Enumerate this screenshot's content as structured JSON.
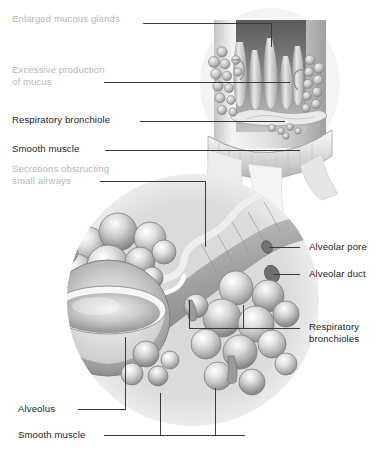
{
  "figure": {
    "style": "grayscale medical airbrush illustration with leader-line callouts",
    "palette": {
      "background": "#ffffff",
      "label_dark": "#1c1c1c",
      "label_gray": "#b9b9b9",
      "leader_line": "#3a3a3a",
      "tissue_light": "#f2f2f2",
      "tissue_mid": "#c9c9c9",
      "tissue_dark": "#8d8d8d",
      "lumen_dark": "#6e6e6e",
      "circle_tint": "#dcdcdc",
      "mucus_white": "#ffffff"
    }
  },
  "labels": [
    {
      "id": "enlarged-mucous-glands",
      "text": "Enlarged mucous glands",
      "tone": "gray",
      "x": 12,
      "y": 18,
      "align": "left"
    },
    {
      "id": "excessive-production-of-mucus",
      "line1": "Excessive production",
      "line2": "of mucus",
      "tone": "gray",
      "x": 12,
      "y": 70,
      "align": "left"
    },
    {
      "id": "respiratory-bronchiole",
      "text": "Respiratory bronchiole",
      "tone": "dark",
      "x": 12,
      "y": 117,
      "align": "left"
    },
    {
      "id": "smooth-muscle-top",
      "text": "Smooth muscle",
      "tone": "dark",
      "x": 12,
      "y": 145,
      "align": "left"
    },
    {
      "id": "secretions-obstructing-small-airways",
      "line1": "Secretions obstructing",
      "line2": "small airways",
      "tone": "gray",
      "x": 12,
      "y": 168,
      "align": "left"
    },
    {
      "id": "alveolar-pore",
      "text": "Alveolar pore",
      "tone": "dark",
      "x": 309,
      "y": 243,
      "align": "left"
    },
    {
      "id": "alveolar-duct",
      "text": "Alveolar duct",
      "tone": "dark",
      "x": 309,
      "y": 270,
      "align": "left"
    },
    {
      "id": "respiratory-bronchioles",
      "line1": "Respiratory",
      "line2": "bronchioles",
      "tone": "dark",
      "x": 309,
      "y": 323,
      "align": "left"
    },
    {
      "id": "alveolus",
      "text": "Alveolus",
      "tone": "dark",
      "x": 18,
      "y": 405,
      "align": "left"
    },
    {
      "id": "smooth-muscle-bottom",
      "text": "Smooth muscle",
      "tone": "dark",
      "x": 18,
      "y": 431,
      "align": "left"
    }
  ],
  "leader_lines": [
    {
      "id": "leader-enlarged-mucous-glands",
      "path": "M143,23 L271,23 L271,47"
    },
    {
      "id": "leader-excessive-mucus",
      "path": "M104,82 L290,82"
    },
    {
      "id": "leader-respiratory-bronchiole",
      "path": "M140,121 L285,121"
    },
    {
      "id": "leader-smooth-muscle-top",
      "path": "M105,150 L300,150"
    },
    {
      "id": "leader-secretions",
      "path": "M100,181 L205,181 L205,247"
    },
    {
      "id": "leader-alveolar-pore",
      "path": "M300,247 L269,247"
    },
    {
      "id": "leader-alveolar-duct",
      "path": "M300,274 L274,274"
    },
    {
      "id": "leader-respiratory-bronchioles",
      "path": "M300,328 L243,328 L243,305 M243,328 L189,328 L189,300"
    },
    {
      "id": "leader-alveolus",
      "path": "M78,409 L125,409 L125,337"
    },
    {
      "id": "leader-smooth-muscle-bottom",
      "path": "M104,435 L245,435 M160,435 L160,393 M215,435 L215,388"
    }
  ],
  "anatomy_regions": [
    {
      "id": "bronchiole-wall-cutaway",
      "note": "upper-right cylindrical bronchiole cut open showing ciliated epithelium, submucosal mucous glands and smooth muscle band"
    },
    {
      "id": "mucous-gland-cluster-left",
      "note": "grape-like cluster of enlarged mucous glands on left wall"
    },
    {
      "id": "mucous-gland-cluster-right",
      "note": "grape-like cluster of enlarged mucous glands on right wall"
    },
    {
      "id": "mucus-pool",
      "note": "pooled mucus at base of bronchiole lumen"
    },
    {
      "id": "alveolar-cluster-left",
      "note": "grape-like cluster of alveoli upper-left of circle"
    },
    {
      "id": "cut-alveolus",
      "note": "large bowl-shaped cut-open alveolus lower-left"
    },
    {
      "id": "alveolar-cluster-right",
      "note": "grape-like cluster of alveoli lower-right of circle"
    },
    {
      "id": "obstructed-duct",
      "note": "white zig-zag secretion-filled alveolar duct running through centre"
    },
    {
      "id": "background-circle",
      "note": "soft gray circular vignette behind lower illustration"
    }
  ]
}
